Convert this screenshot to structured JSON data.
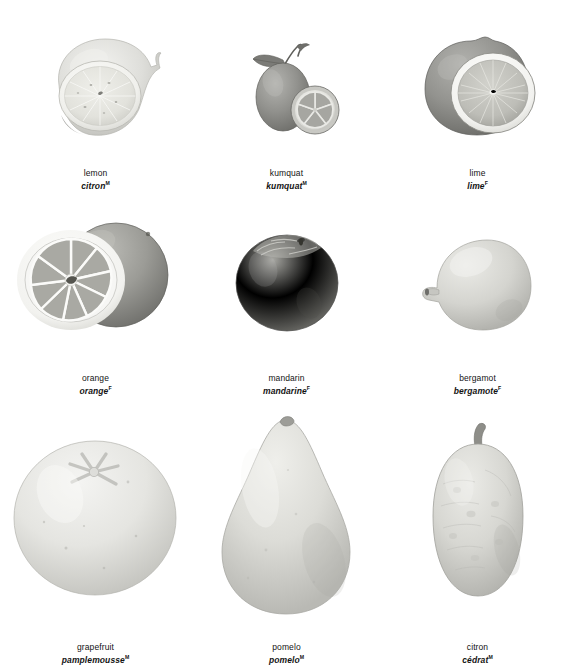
{
  "plate": {
    "title": "Citrus fruits",
    "layout": {
      "columns": 3,
      "rows": 3
    },
    "background_color": "#ffffff",
    "text_color": "#131313"
  },
  "items": [
    {
      "id": "lemon",
      "name_en": "lemon",
      "name_fr": "citron",
      "gender": "M",
      "depiction": "whole pale lemon with a cut half in front showing radial segments",
      "tone_outer": "#d9d9d6",
      "tone_flesh": "#e8e8e4",
      "tone_rind": "#f4f4f1"
    },
    {
      "id": "kumquat",
      "name_en": "kumquat",
      "name_fr": "kumquat",
      "gender": "M",
      "depiction": "small dark oval fruit with leaf and stem, plus a cut slice with five wedges",
      "tone_outer": "#8d8d8a",
      "tone_flesh": "#b9b9b4",
      "tone_rind": "#e3e3df"
    },
    {
      "id": "lime",
      "name_en": "lime",
      "name_fr": "lime",
      "gender": "F",
      "depiction": "dark whole lime behind a cut half with thick white pith and radial segments",
      "tone_outer": "#8f8f8c",
      "tone_flesh": "#b5b5af",
      "tone_rind": "#f0f0ec"
    },
    {
      "id": "orange",
      "name_en": "orange",
      "name_fr": "orange",
      "gender": "F",
      "depiction": "cut orange half with nine segments divided by white membranes, whole fruit behind",
      "tone_outer": "#949491",
      "tone_flesh": "#a8a8a3",
      "tone_rind": "#f1f1ee"
    },
    {
      "id": "mandarin",
      "name_en": "mandarin",
      "name_fr": "mandarine",
      "gender": "F",
      "depiction": "whole dark flattened mandarin with textured stem end",
      "tone_outer": "#83837f",
      "tone_flesh": "#9c9c98",
      "tone_rind": "#bdbdb8"
    },
    {
      "id": "bergamot",
      "name_en": "bergamot",
      "name_fr": "bergamote",
      "gender": "F",
      "depiction": "pale round bergamot with a nipple-like protrusion on the left",
      "tone_outer": "#c9c9c4",
      "tone_flesh": "#dcdcd7",
      "tone_rind": "#ececE7"
    },
    {
      "id": "grapefruit",
      "name_en": "grapefruit",
      "name_fr": "pamplemousse",
      "gender": "M",
      "depiction": "large pale round grapefruit with a star-shaped stem scar on top",
      "tone_outer": "#dedeDA",
      "tone_flesh": "#ebebe7",
      "tone_rind": "#f6f6f3"
    },
    {
      "id": "pomelo",
      "name_en": "pomelo",
      "name_fr": "pomelo",
      "gender": "M",
      "depiction": "large pale teardrop-shaped pomelo with a small stem on top",
      "tone_outer": "#d2d2ce",
      "tone_flesh": "#e3e3df",
      "tone_rind": "#f2f2ef"
    },
    {
      "id": "citron",
      "name_en": "citron",
      "name_fr": "cédrat",
      "gender": "M",
      "depiction": "pale bumpy oval citron with a short woody stem at the top",
      "tone_outer": "#cecec9",
      "tone_flesh": "#e0e0db",
      "tone_rind": "#efefeb"
    }
  ]
}
